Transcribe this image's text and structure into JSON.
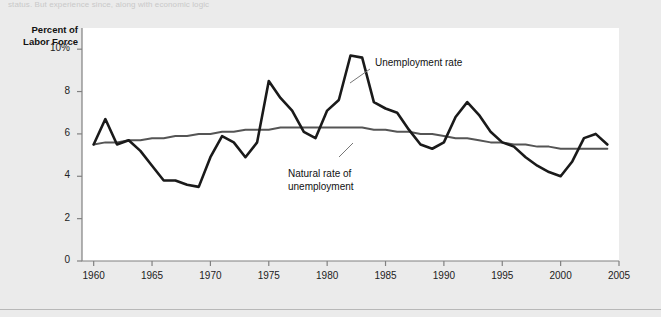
{
  "figure": {
    "truncated_caption": "status. But experience since, along with economic logic",
    "background_color": "#ebebeb",
    "plot_background_color": "#ffffff",
    "axis_color": "#808080"
  },
  "chart_data": {
    "type": "line",
    "title": "",
    "subtitle": "",
    "xlabel": "",
    "ylabel": "Percent of Labor Force",
    "ylabel_line1": "Percent of",
    "ylabel_line2": "Labor Force",
    "xlim": [
      1959,
      2005
    ],
    "ylim": [
      0,
      11
    ],
    "grid": false,
    "legend_position": "inline-annotations",
    "ytick_labels": [
      "0",
      "2",
      "4",
      "6",
      "8",
      "10%"
    ],
    "ytick_values": [
      0,
      2,
      4,
      6,
      8,
      10
    ],
    "xtick_labels": [
      "1960",
      "1965",
      "1970",
      "1975",
      "1980",
      "1985",
      "1990",
      "1995",
      "2000",
      "2005"
    ],
    "xtick_values": [
      1960,
      1965,
      1970,
      1975,
      1980,
      1985,
      1990,
      1995,
      2000,
      2005
    ],
    "annotations": [
      {
        "text": "Unemployment rate",
        "series": "Unemployment rate",
        "x": 1984.2,
        "y": 10.3
      },
      {
        "text": "Natural rate of unemployment",
        "line1": "Natural rate of",
        "line2": "unemployment",
        "series": "Natural rate of unemployment",
        "x": 1978.0,
        "y": 4.6
      }
    ],
    "x": [
      1960,
      1961,
      1962,
      1963,
      1964,
      1965,
      1966,
      1967,
      1968,
      1969,
      1970,
      1971,
      1972,
      1973,
      1974,
      1975,
      1976,
      1977,
      1978,
      1979,
      1980,
      1981,
      1982,
      1983,
      1984,
      1985,
      1986,
      1987,
      1988,
      1989,
      1990,
      1991,
      1992,
      1993,
      1994,
      1995,
      1996,
      1997,
      1998,
      1999,
      2000,
      2001,
      2002,
      2003,
      2004
    ],
    "series": [
      {
        "name": "Unemployment rate",
        "color": "#1a1a1a",
        "width": 2.6,
        "values": [
          5.5,
          6.7,
          5.5,
          5.7,
          5.2,
          4.5,
          3.8,
          3.8,
          3.6,
          3.5,
          4.9,
          5.9,
          5.6,
          4.9,
          5.6,
          8.5,
          7.7,
          7.1,
          6.1,
          5.8,
          7.1,
          7.6,
          9.7,
          9.6,
          7.5,
          7.2,
          7.0,
          6.2,
          5.5,
          5.3,
          5.6,
          6.8,
          7.5,
          6.9,
          6.1,
          5.6,
          5.4,
          4.9,
          4.5,
          4.2,
          4.0,
          4.7,
          5.8,
          6.0,
          5.5
        ]
      },
      {
        "name": "Natural rate of unemployment",
        "color": "#555555",
        "width": 2.0,
        "values": [
          5.5,
          5.6,
          5.6,
          5.7,
          5.7,
          5.8,
          5.8,
          5.9,
          5.9,
          6.0,
          6.0,
          6.1,
          6.1,
          6.2,
          6.2,
          6.2,
          6.3,
          6.3,
          6.3,
          6.3,
          6.3,
          6.3,
          6.3,
          6.3,
          6.2,
          6.2,
          6.1,
          6.1,
          6.0,
          6.0,
          5.9,
          5.8,
          5.8,
          5.7,
          5.6,
          5.6,
          5.5,
          5.5,
          5.4,
          5.4,
          5.3,
          5.3,
          5.3,
          5.3,
          5.3
        ]
      }
    ]
  }
}
